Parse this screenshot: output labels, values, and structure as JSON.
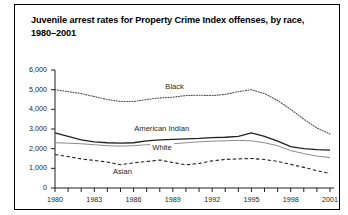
{
  "figure": {
    "title": "Juvenile arrest rates for Property Crime Index offenses, by race, 1980–2001",
    "background": "#ffffff",
    "border_color": "#000000"
  },
  "chart_data": {
    "type": "line",
    "title": "Juvenile arrest rates for Property Crime Index offenses, by race, 1980–2001",
    "xlabel": "",
    "ylabel": "",
    "xlim": [
      1980,
      2001
    ],
    "ylim": [
      0,
      6000
    ],
    "grid": false,
    "legend_position": "inline-labels",
    "x": [
      1980,
      1981,
      1982,
      1983,
      1984,
      1985,
      1986,
      1987,
      1988,
      1989,
      1990,
      1991,
      1992,
      1993,
      1994,
      1995,
      1996,
      1997,
      1998,
      1999,
      2000,
      2001
    ],
    "y_ticks": [
      0,
      1000,
      2000,
      3000,
      4000,
      5000,
      6000
    ],
    "y_tick_labels": [
      "0",
      "1,000",
      "2,000",
      "3,000",
      "4,000",
      "5,000",
      "6,000"
    ],
    "x_ticks": [
      1980,
      1983,
      1986,
      1989,
      1992,
      1995,
      1998,
      2001
    ],
    "x_tick_labels": [
      "1980",
      "1983",
      "1986",
      "1989",
      "1992",
      "1995",
      "1998",
      "2001"
    ],
    "series": [
      {
        "name": "Black",
        "style": "dotted",
        "color": "#4d4d4d",
        "label_x": 1989,
        "label_y": 5150,
        "values": [
          5000,
          4900,
          4800,
          4650,
          4500,
          4400,
          4400,
          4500,
          4580,
          4620,
          4700,
          4720,
          4700,
          4760,
          4900,
          5000,
          4800,
          4450,
          4000,
          3500,
          3050,
          2750
        ]
      },
      {
        "name": "American Indian",
        "style": "solid",
        "color": "#231f20",
        "label_x": 1988,
        "label_y": 3000,
        "values": [
          2800,
          2620,
          2450,
          2350,
          2300,
          2280,
          2300,
          2400,
          2450,
          2470,
          2500,
          2520,
          2560,
          2580,
          2620,
          2800,
          2620,
          2380,
          2100,
          2000,
          1950,
          1930
        ]
      },
      {
        "name": "White",
        "style": "solid-light",
        "color": "#8c8c8c",
        "label_x": 1988,
        "label_y": 2050,
        "values": [
          2300,
          2280,
          2250,
          2200,
          2150,
          2130,
          2150,
          2200,
          2230,
          2250,
          2300,
          2350,
          2380,
          2400,
          2420,
          2400,
          2300,
          2150,
          1900,
          1750,
          1620,
          1550
        ]
      },
      {
        "name": "Asian",
        "style": "dashed",
        "color": "#231f20",
        "label_x": 1985,
        "label_y": 820,
        "values": [
          1700,
          1600,
          1480,
          1400,
          1320,
          1180,
          1280,
          1350,
          1420,
          1300,
          1180,
          1250,
          1380,
          1450,
          1480,
          1500,
          1450,
          1350,
          1200,
          1050,
          880,
          730
        ]
      }
    ]
  }
}
